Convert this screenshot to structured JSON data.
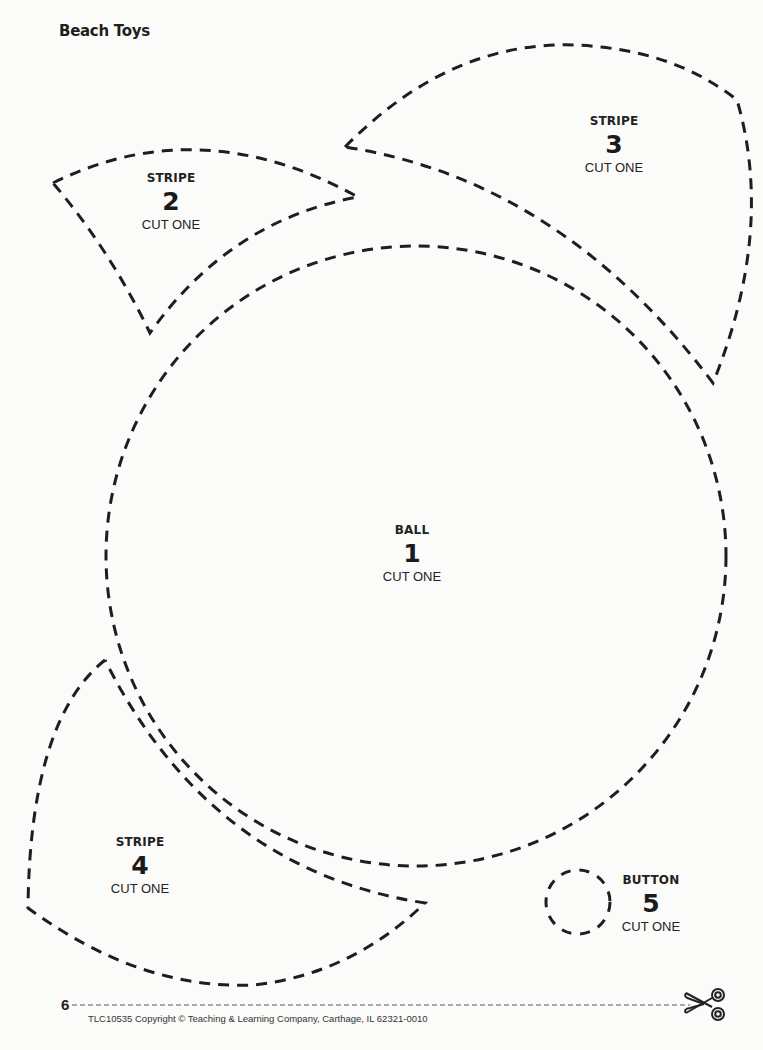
{
  "page": {
    "title": "Beach Toys",
    "page_number": "6",
    "copyright": "TLC10535 Copyright © Teaching & Learning Company, Carthage, IL  62321-0010"
  },
  "pieces": [
    {
      "id": "ball",
      "kind": "BALL",
      "number": "1",
      "instruction": "CUT ONE"
    },
    {
      "id": "stripe-2",
      "kind": "STRIPE",
      "number": "2",
      "instruction": "CUT ONE"
    },
    {
      "id": "stripe-3",
      "kind": "STRIPE",
      "number": "3",
      "instruction": "CUT ONE"
    },
    {
      "id": "stripe-4",
      "kind": "STRIPE",
      "number": "4",
      "instruction": "CUT ONE"
    },
    {
      "id": "button",
      "kind": "BUTTON",
      "number": "5",
      "instruction": "CUT ONE"
    }
  ],
  "icons": {
    "cut_line": "scissors-icon"
  },
  "colors": {
    "ink": "#1e1e1e",
    "paper": "#fbfbfa"
  }
}
